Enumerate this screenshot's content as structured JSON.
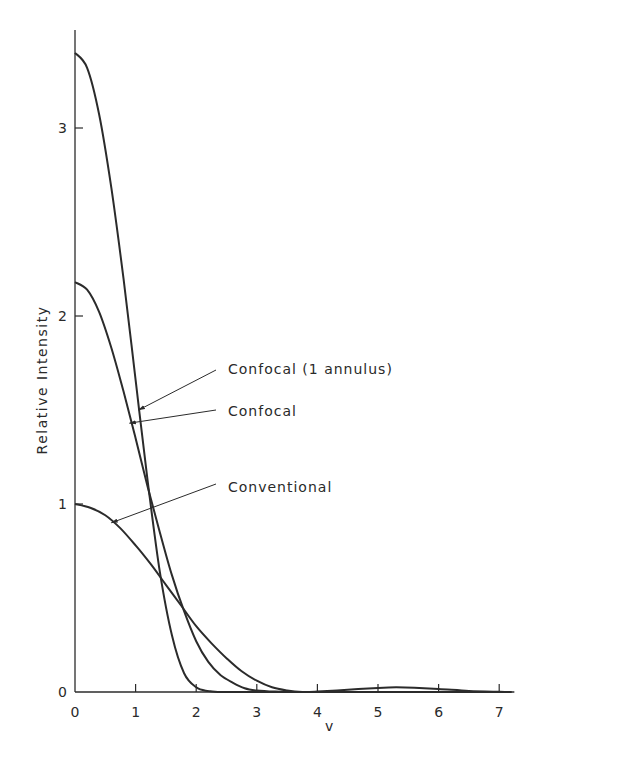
{
  "chart_data": {
    "type": "line",
    "title": "",
    "xlabel": "v",
    "ylabel": "Relative Intensity",
    "xlim": [
      0,
      7.2
    ],
    "ylim": [
      0,
      3.5
    ],
    "grid": false,
    "legend": "none (inline annotations with leader arrows)",
    "x_ticks": [
      "0",
      "1",
      "2",
      "3",
      "4",
      "5",
      "6",
      "7"
    ],
    "y_ticks": [
      "0",
      "1",
      "2",
      "3"
    ],
    "series": [
      {
        "name": "Conventional",
        "x": [
          0,
          0.25,
          0.5,
          0.75,
          1.0,
          1.25,
          1.5,
          1.75,
          2.0,
          2.25,
          2.5,
          2.75,
          3.0,
          3.25,
          3.5,
          3.75,
          4.0,
          4.5,
          5.0,
          5.3,
          5.6,
          6.0,
          6.5,
          7.0,
          7.2
        ],
        "y": [
          1.0,
          0.98,
          0.94,
          0.87,
          0.78,
          0.68,
          0.57,
          0.46,
          0.35,
          0.26,
          0.18,
          0.11,
          0.06,
          0.025,
          0.008,
          0.0,
          0.002,
          0.012,
          0.022,
          0.025,
          0.023,
          0.016,
          0.006,
          0.001,
          0.0
        ]
      },
      {
        "name": "Confocal",
        "x": [
          0,
          0.2,
          0.4,
          0.6,
          0.8,
          1.0,
          1.2,
          1.4,
          1.6,
          1.8,
          2.0,
          2.2,
          2.4,
          2.6,
          2.8,
          3.0,
          3.3,
          3.6,
          4.0,
          7.2
        ],
        "y": [
          2.18,
          2.14,
          2.02,
          1.83,
          1.6,
          1.35,
          1.09,
          0.85,
          0.62,
          0.43,
          0.27,
          0.16,
          0.09,
          0.05,
          0.02,
          0.008,
          0.002,
          0.0,
          0.0,
          0.0
        ]
      },
      {
        "name": "Confocal (1 annulus)",
        "x": [
          0,
          0.2,
          0.4,
          0.6,
          0.8,
          1.0,
          1.2,
          1.4,
          1.6,
          1.8,
          2.0,
          2.2,
          2.4,
          2.6,
          3.0,
          7.2
        ],
        "y": [
          3.4,
          3.32,
          3.07,
          2.68,
          2.2,
          1.66,
          1.12,
          0.64,
          0.3,
          0.1,
          0.025,
          0.005,
          0.0,
          0.0,
          0.0,
          0.0
        ]
      }
    ],
    "annotations": [
      {
        "text": "Confocal (1 annulus)",
        "points_to": "Confocal (1 annulus)",
        "at": [
          1.05,
          1.5
        ]
      },
      {
        "text": "Confocal",
        "points_to": "Confocal",
        "at": [
          0.9,
          1.43
        ]
      },
      {
        "text": "Conventional",
        "points_to": "Conventional",
        "at": [
          0.6,
          0.9
        ]
      }
    ]
  },
  "labels": {
    "x_axis_title": "v",
    "y_axis_title": "Relative Intensity",
    "ann_annulus": "Confocal (1 annulus)",
    "ann_confocal": "Confocal",
    "ann_conventional": "Conventional"
  },
  "style": {
    "line_color": "#2b2b2b",
    "axis_color": "#2b2b2b"
  }
}
